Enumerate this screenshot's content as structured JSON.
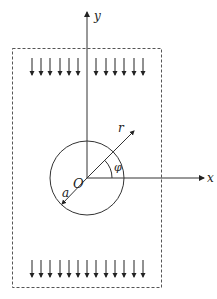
{
  "diagram": {
    "labels": {
      "y_axis": "y",
      "x_axis": "x",
      "origin": "O",
      "radius_r": "r",
      "hole_radius": "a",
      "angle": "φ"
    },
    "top_load": {
      "left_arrow_count": 6,
      "right_arrow_count": 6
    },
    "bottom_load": {
      "arrow_count": 13
    },
    "colors": {
      "line": "#333333",
      "dashed_border": "#555555"
    }
  }
}
